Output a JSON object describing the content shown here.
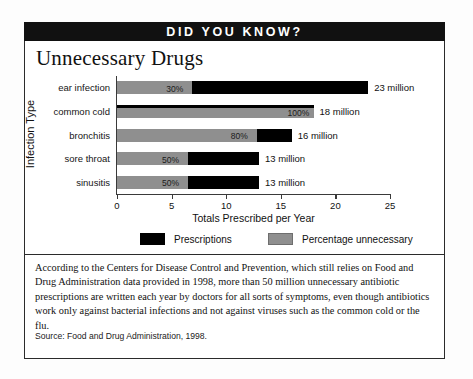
{
  "banner": {
    "label": "DID YOU KNOW?"
  },
  "chart_title": "Unnecessary Drugs",
  "legend": {
    "prescriptions_label": "Prescriptions",
    "unnecessary_label": "Percentage unnecessary",
    "prescriptions_color": "#000000",
    "unnecessary_color": "#8f8f8f"
  },
  "body_text": "According to the Centers for Disease Control and Prevention, which still relies on Food and Drug Administration data provided in 1998, more than 50 million unnecessary antibiotic prescriptions are written each year by doctors for all sorts of symptoms, even though antibiotics work only against bacterial infections and not against viruses such as the common cold or the flu.",
  "source": "Source: Food and Drug Administration, 1998.",
  "chart_data": {
    "type": "bar",
    "orientation": "horizontal",
    "title": "Unnecessary Drugs",
    "xlabel": "Totals Prescribed per Year",
    "ylabel": "Infection Type",
    "xlim": [
      0,
      25
    ],
    "xticks": [
      0,
      5,
      10,
      15,
      20,
      25
    ],
    "xtick_labels": [
      "0",
      "5",
      "10",
      "15",
      "20",
      "25"
    ],
    "grid": false,
    "legend_position": "bottom",
    "categories": [
      "ear infection",
      "common cold",
      "bronchitis",
      "sore throat",
      "sinusitis"
    ],
    "series": [
      {
        "name": "Prescriptions",
        "color": "#000000",
        "units": "million",
        "values": [
          23,
          18,
          16,
          13,
          13
        ]
      },
      {
        "name": "Percentage unnecessary",
        "color": "#8f8f8f",
        "units": "percent",
        "values": [
          30,
          100,
          80,
          50,
          50
        ]
      }
    ],
    "rows": [
      {
        "category": "ear infection",
        "total": 23,
        "total_label": "23 million",
        "percent": 30,
        "percent_label": "30%"
      },
      {
        "category": "common cold",
        "total": 18,
        "total_label": "18 million",
        "percent": 100,
        "percent_label": "100%"
      },
      {
        "category": "bronchitis",
        "total": 16,
        "total_label": "16 million",
        "percent": 80,
        "percent_label": "80%"
      },
      {
        "category": "sore throat",
        "total": 13,
        "total_label": "13 million",
        "percent": 50,
        "percent_label": "50%"
      },
      {
        "category": "sinusitis",
        "total": 13,
        "total_label": "13 million",
        "percent": 50,
        "percent_label": "50%"
      }
    ]
  }
}
